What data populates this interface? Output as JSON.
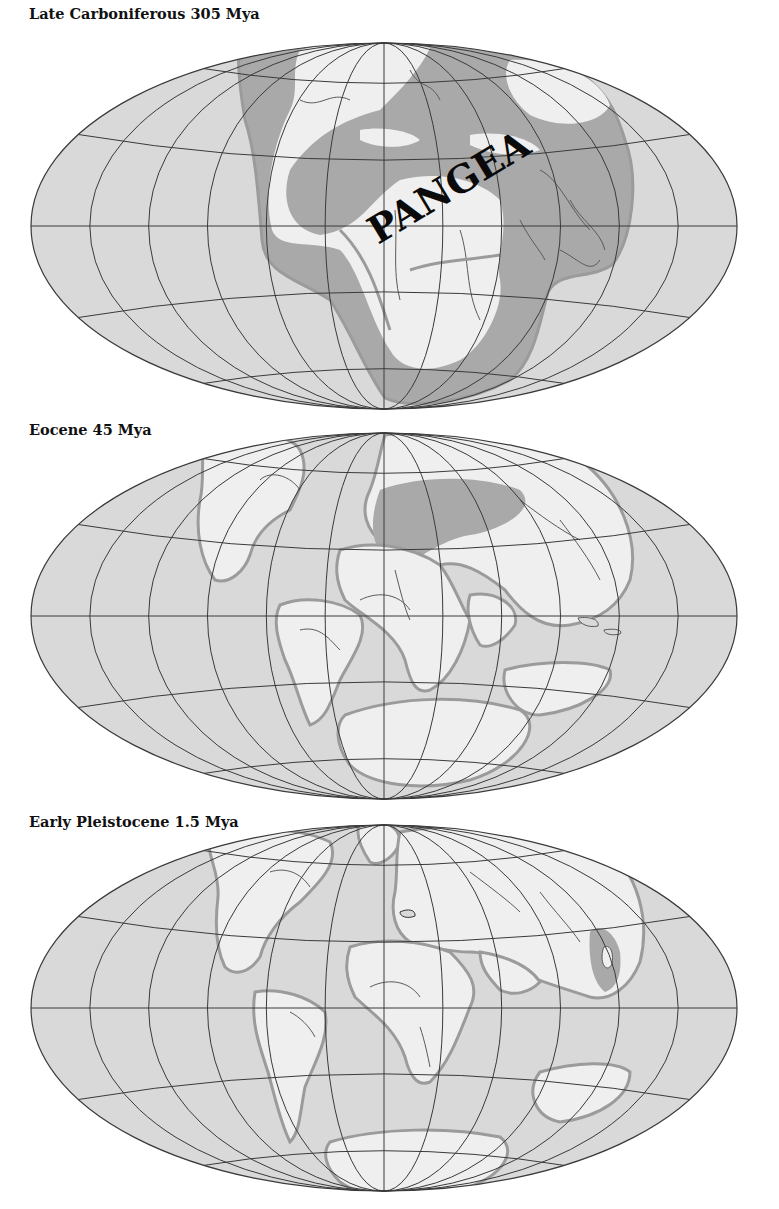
{
  "figure": {
    "colors": {
      "ocean": "#d9d9d9",
      "land": "#efefef",
      "shelf": "#a9a9a9",
      "coast": "#9b9b9b",
      "grid": "#3a3a3a",
      "river": "#6a6a6a"
    },
    "grid": {
      "meridian_count": 13,
      "parallels_deg": [
        -60,
        -30,
        0,
        30,
        60
      ]
    },
    "maps": [
      {
        "title": "Late Carboniferous 305 Mya",
        "label": "PANGEA",
        "title_y": 5,
        "svg_top": 30,
        "cx": 384,
        "cy": 196,
        "rx": 353,
        "ry": 183
      },
      {
        "title": "Eocene 45 Mya",
        "title_y": 421,
        "svg_top": 420,
        "cx": 384,
        "cy": 196,
        "rx": 353,
        "ry": 183
      },
      {
        "title": "Early Pleistocene 1.5 Mya",
        "title_y": 813,
        "svg_top": 812,
        "cx": 384,
        "cy": 196,
        "rx": 353,
        "ry": 183
      }
    ]
  }
}
